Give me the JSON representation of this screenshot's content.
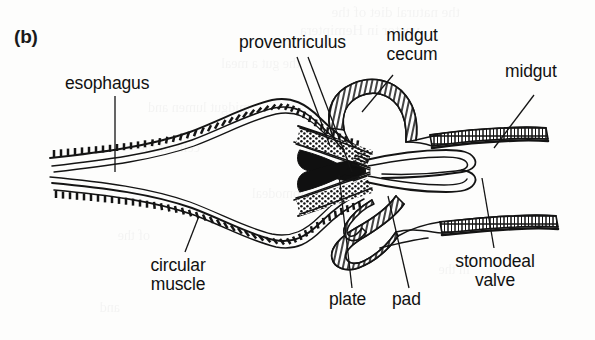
{
  "figure": {
    "panel_letter": "(b)",
    "background_color": "#fdfdfc",
    "ink_color": "#111111"
  },
  "labels": {
    "esophagus": "esophagus",
    "proventriculus": "proventriculus",
    "midgut_cecum_line1": "midgut",
    "midgut_cecum_line2": "cecum",
    "midgut": "midgut",
    "circular_muscle_line1": "circular",
    "circular_muscle_line2": "muscle",
    "plate": "plate",
    "pad": "pad",
    "stomodeal_valve_line1": "stomodeal",
    "stomodeal_valve_line2": "valve"
  },
  "bleed_through": {
    "note": "faint mirrored show-through text from the reverse page",
    "lines": [
      "the natural diet of the",
      "vector in Hemiptera",
      "the gut a meal",
      "midgut lumen and",
      "cells of the",
      "the stomodeal",
      "of the",
      "in the",
      "and"
    ]
  }
}
